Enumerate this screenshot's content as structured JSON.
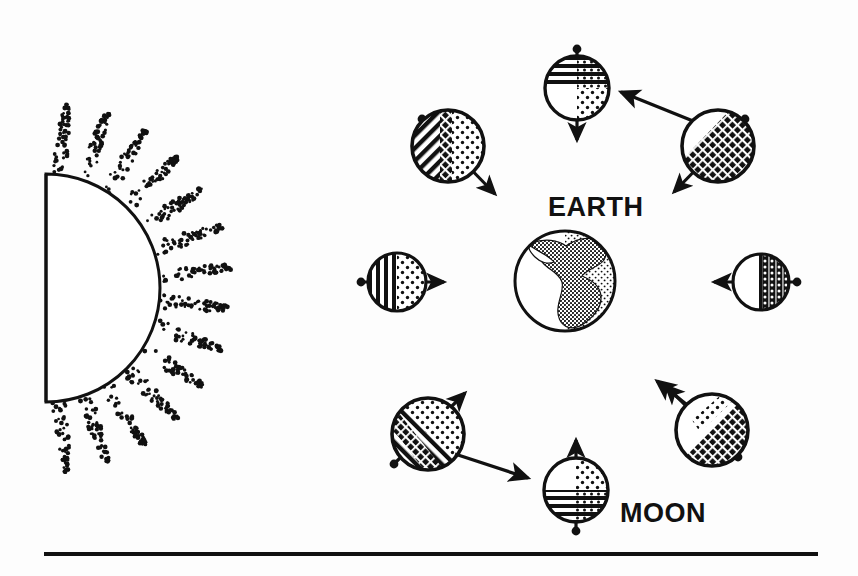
{
  "figure": {
    "title_labels": {
      "earth": "EARTH",
      "moon": "MOON"
    },
    "background_color": "#fdfdfd",
    "ink_color": "#111111",
    "footer_rule": {
      "present": true,
      "color": "#111111"
    }
  },
  "sun": {
    "name": "sun-half-disc",
    "description": "half disc at left edge with stippled radiating rays",
    "flat_edge_x": 46,
    "center_y": 288,
    "radius": 114,
    "ray_count": 14,
    "ray_outer_radius": 186,
    "fill": "#ffffff",
    "outline_color": "#111111",
    "stipple_color": "#111111"
  },
  "earth": {
    "name": "earth-globe",
    "center_x": 565,
    "center_y": 281,
    "radius": 51,
    "lit_side": "left",
    "dark_side": "right",
    "dark_fill_pattern": "stipple",
    "continents": "Americas silhouette, dense stipple",
    "label": "EARTH",
    "label_x": 548,
    "label_y": 216
  },
  "moons": [
    {
      "id": "moon-new",
      "name": "moon-position-top",
      "position_label": "top",
      "center_x": 577,
      "center_y": 88,
      "radius": 33,
      "near_side_shading": "horizontal-lines",
      "far_side_shading": "stipple",
      "shading_split": "top-half lines, bottom-right stipple",
      "axis_arrow": "vertical-down",
      "axis_arrow_angle_deg": 90,
      "has_axis_dot": true,
      "orbital_arrow": false
    },
    {
      "id": "moon-upper-left",
      "name": "moon-position-upper-left",
      "position_label": "upper-left",
      "center_x": 448,
      "center_y": 146,
      "radius": 37,
      "near_side_shading": "diagonal-hatch",
      "far_side_shading": "stipple",
      "shading_split": "left diagonal hatch, right stipple",
      "axis_arrow": "diagonal-down-right",
      "axis_arrow_angle_deg": 48,
      "has_axis_dot": true,
      "orbital_arrow": false
    },
    {
      "id": "moon-upper-right",
      "name": "moon-position-upper-right",
      "position_label": "upper-right",
      "center_x": 718,
      "center_y": 146,
      "radius": 37,
      "near_side_shading": "diagonal-hatch-dense",
      "far_side_shading": "dark-hatch",
      "shading_split": "upper-left white, remainder dense diagonal hatch",
      "axis_arrow": "diagonal-down-left",
      "axis_arrow_angle_deg": 132,
      "has_axis_dot": true,
      "orbital_arrow": true,
      "orbital_arrow_direction": "up-left-toward-top"
    },
    {
      "id": "moon-left",
      "name": "moon-position-left",
      "position_label": "left",
      "center_x": 397,
      "center_y": 282,
      "radius": 30,
      "near_side_shading": "vertical-lines",
      "far_side_shading": "stipple",
      "shading_split": "left half vertical lines, right half stipple",
      "axis_arrow": "horizontal-right",
      "axis_arrow_angle_deg": 0,
      "has_axis_dot": true,
      "orbital_arrow": false
    },
    {
      "id": "moon-right",
      "name": "moon-position-right",
      "position_label": "right",
      "center_x": 761,
      "center_y": 282,
      "radius": 29,
      "near_side_shading": "white",
      "far_side_shading": "vertical-dot-grid",
      "shading_split": "left half white, right half vertical dotted grid",
      "axis_arrow": "horizontal-left",
      "axis_arrow_angle_deg": 180,
      "has_axis_dot": true,
      "orbital_arrow": false
    },
    {
      "id": "moon-lower-left",
      "name": "moon-position-lower-left",
      "position_label": "lower-left",
      "center_x": 428,
      "center_y": 434,
      "radius": 37,
      "near_side_shading": "diagonal-hatch",
      "far_side_shading": "stipple",
      "shading_split": "lower-left diagonal hatch, upper-right stipple",
      "axis_arrow": "diagonal-up-right",
      "axis_arrow_angle_deg": -55,
      "has_axis_dot": true,
      "orbital_arrow": true,
      "orbital_arrow_direction": "down-right"
    },
    {
      "id": "moon-full",
      "name": "moon-position-bottom",
      "position_label": "bottom",
      "center_x": 576,
      "center_y": 490,
      "radius": 33,
      "near_side_shading": "horizontal-lines",
      "far_side_shading": "stipple",
      "shading_split": "upper-right stipple, bottom half horizontal lines",
      "axis_arrow": "vertical-up",
      "axis_arrow_angle_deg": -90,
      "has_axis_dot": true,
      "orbital_arrow": false,
      "label": "MOON",
      "label_x": 620,
      "label_y": 522
    },
    {
      "id": "moon-lower-right",
      "name": "moon-position-lower-right",
      "position_label": "lower-right",
      "center_x": 712,
      "center_y": 430,
      "radius": 37,
      "near_side_shading": "white",
      "far_side_shading": "diagonal-hatch-dense",
      "shading_split": "upper-left white, lower-right dense diagonal hatch",
      "axis_arrow": "diagonal-up-left",
      "axis_arrow_angle_deg": -135,
      "has_axis_dot": true,
      "orbital_arrow": true,
      "orbital_arrow_direction": "up-left"
    }
  ],
  "footer_rule_geometry": {
    "x1": 44,
    "x2": 818,
    "y": 554,
    "thickness": 4
  }
}
